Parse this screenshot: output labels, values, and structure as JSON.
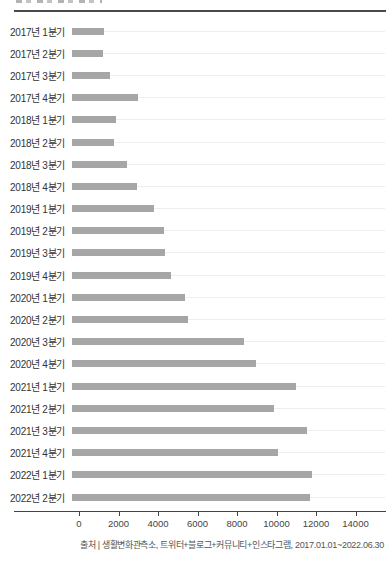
{
  "chart_data": {
    "type": "bar",
    "orientation": "horizontal",
    "title": "",
    "xlabel": "",
    "ylabel": "",
    "categories": [
      "2017년 1분기",
      "2017년 2분기",
      "2017년 3분기",
      "2017년 4분기",
      "2018년 1분기",
      "2018년 2분기",
      "2018년 3분기",
      "2018년 4분기",
      "2019년 1분기",
      "2019년 2분기",
      "2019년 3분기",
      "2019년 4분기",
      "2020년 1분기",
      "2020년 2분기",
      "2020년 3분기",
      "2020년 4분기",
      "2021년 1분기",
      "2021년 2분기",
      "2021년 3분기",
      "2021년 4분기",
      "2022년 1분기",
      "2022년 2분기"
    ],
    "values": [
      1600,
      1550,
      1900,
      3350,
      2200,
      2100,
      2800,
      3300,
      4150,
      4650,
      4700,
      5000,
      5700,
      5850,
      8700,
      9300,
      11350,
      10250,
      11900,
      10450,
      12150,
      12050
    ],
    "x_ticks": [
      0,
      2000,
      4000,
      6000,
      8000,
      10000,
      12000,
      14000
    ],
    "xlim": [
      0,
      14000
    ],
    "legend": "none",
    "grid": "faint horizontal leader line per row",
    "bar_color": "#a6a6a6",
    "axis_color": "#444444",
    "label_color": "#333333",
    "source": "출처 | 생활변화관측소, 트위터+블로그+커뮤니티+인스타그램, 2017.01.01~2022.06.30"
  }
}
